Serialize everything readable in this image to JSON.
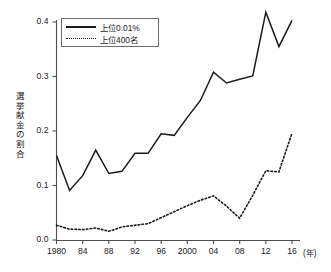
{
  "chart_data": {
    "type": "line",
    "title": "",
    "xlabel": "(年)",
    "ylabel": "選挙献金の割合",
    "xlim": [
      1980,
      2016
    ],
    "ylim": [
      0.0,
      0.4
    ],
    "grid": false,
    "legend_position": "top-left",
    "x": [
      1980,
      1982,
      1984,
      1986,
      1988,
      1990,
      1992,
      1994,
      1996,
      1998,
      2000,
      2002,
      2004,
      2006,
      2008,
      2010,
      2012,
      2014,
      2016
    ],
    "x_tick_labels": [
      "1980",
      "84",
      "88",
      "92",
      "96",
      "2000",
      "04",
      "08",
      "12",
      "16"
    ],
    "x_tick_values": [
      1980,
      1984,
      1988,
      1992,
      1996,
      2000,
      2004,
      2008,
      2012,
      2016
    ],
    "y_tick_labels": [
      "0.0",
      "0.1",
      "0.2",
      "0.3",
      "0.4"
    ],
    "y_tick_values": [
      0.0,
      0.1,
      0.2,
      0.3,
      0.4
    ],
    "series": [
      {
        "name": "上位0.01%",
        "style": "solid",
        "color": "#1a1a1a",
        "values": [
          0.155,
          0.091,
          0.118,
          0.165,
          0.122,
          0.126,
          0.159,
          0.159,
          0.195,
          0.192,
          0.225,
          0.256,
          0.308,
          0.288,
          0.295,
          0.301,
          0.418,
          0.355,
          0.403
        ]
      },
      {
        "name": "上位400名",
        "style": "dotted",
        "color": "#1a1a1a",
        "values": [
          0.027,
          0.02,
          0.019,
          0.022,
          0.016,
          0.024,
          0.027,
          0.03,
          0.041,
          0.052,
          0.063,
          0.073,
          0.081,
          0.062,
          0.04,
          0.082,
          0.127,
          0.125,
          0.196
        ]
      }
    ]
  },
  "axis": {
    "y_label_chars": [
      "選",
      "挙",
      "献",
      "金",
      "の",
      "割",
      "合"
    ],
    "x_unit": "(年)"
  },
  "legend": {
    "items": [
      {
        "label": "上位0.01%",
        "style": "solid"
      },
      {
        "label": "上位400名",
        "style": "dotted"
      }
    ]
  }
}
